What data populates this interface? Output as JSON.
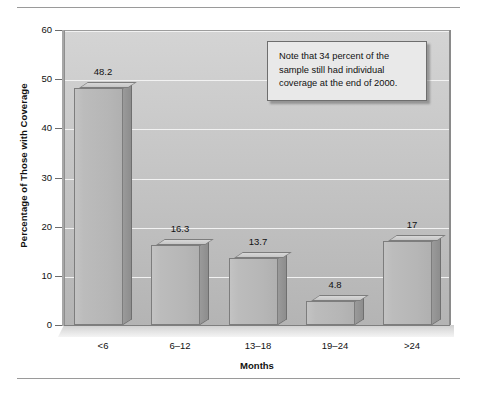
{
  "chart_data": {
    "type": "bar",
    "title": "",
    "subtitle": "",
    "categories": [
      "<6",
      "6–12",
      "13–18",
      "19–24",
      ">24"
    ],
    "values": [
      48.2,
      16.3,
      13.7,
      4.8,
      17
    ],
    "data_labels": [
      "48.2",
      "16.3",
      "13.7",
      "4.8",
      "17"
    ],
    "xlabel": "Months",
    "ylabel": "Percentage of Those with Coverage",
    "ylim": [
      0,
      60
    ],
    "yticks": [
      0,
      10,
      20,
      30,
      40,
      50,
      60
    ],
    "ytick_labels": [
      "0",
      "10",
      "20",
      "30",
      "40",
      "50",
      "60"
    ],
    "grid": true,
    "grid_axis": "y",
    "legend": false,
    "legend_position": "none",
    "annotations": [
      {
        "name": "note-callout",
        "text": "Note that 34 percent of the sample still had individual coverage at the end of 2000."
      }
    ],
    "style": {
      "three_d": true,
      "bar_face_color": "#b8b8b8",
      "bar_side_color": "#939393",
      "bar_top_color": "#d0d0d0",
      "bar_edge_color": "#7d7d7d",
      "plot_background_top": "#d4d4d4",
      "plot_background_bottom": "#b4b4b4",
      "gridline_color": "#f2f2f2",
      "text_color": "#111111",
      "note_box_background": "#e9e9e9",
      "note_box_border": "#6e6e6e",
      "page_background": "#ffffff",
      "rule_color": "#9a9a9a"
    }
  },
  "axes": {
    "y_title": "Percentage of Those with Coverage",
    "x_title": "Months"
  },
  "note": {
    "text": "Note that 34 percent of the sample still had individual coverage at the end of 2000."
  }
}
